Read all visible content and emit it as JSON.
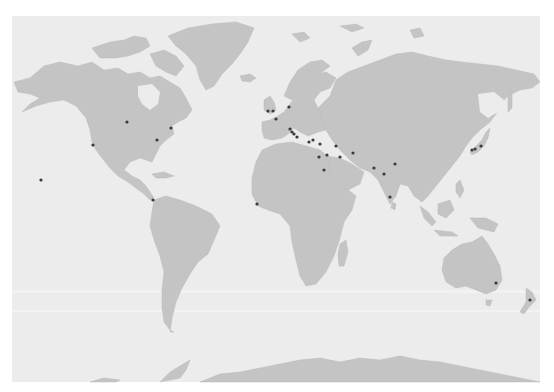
{
  "map": {
    "type": "world-map",
    "projection": "miller-like cylindrical",
    "colors": {
      "ocean": "#ececec",
      "land": "#c4c4c4",
      "marker": "#3a3a3a",
      "background": "#ffffff"
    },
    "markers": [
      {
        "region": "Hawaii",
        "x": 41,
        "y": 180
      },
      {
        "region": "US West Coast",
        "x": 93,
        "y": 145
      },
      {
        "region": "US Central",
        "x": 127,
        "y": 122
      },
      {
        "region": "US Northeast",
        "x": 171,
        "y": 128
      },
      {
        "region": "US East",
        "x": 157,
        "y": 140
      },
      {
        "region": "Panama",
        "x": 153,
        "y": 200
      },
      {
        "region": "West Africa",
        "x": 257,
        "y": 204
      },
      {
        "region": "UK 1",
        "x": 268,
        "y": 111
      },
      {
        "region": "UK 2",
        "x": 273,
        "y": 111
      },
      {
        "region": "France",
        "x": 276,
        "y": 119
      },
      {
        "region": "Northern Europe",
        "x": 289,
        "y": 107
      },
      {
        "region": "Italy 1",
        "x": 290,
        "y": 129
      },
      {
        "region": "Italy 2",
        "x": 292,
        "y": 132
      },
      {
        "region": "Italy 3",
        "x": 294,
        "y": 134
      },
      {
        "region": "Italy 4",
        "x": 297,
        "y": 137
      },
      {
        "region": "Greece",
        "x": 309,
        "y": 142
      },
      {
        "region": "Turkey 1",
        "x": 313,
        "y": 140
      },
      {
        "region": "Turkey 2",
        "x": 320,
        "y": 144
      },
      {
        "region": "Egypt",
        "x": 319,
        "y": 157
      },
      {
        "region": "Levant",
        "x": 327,
        "y": 155
      },
      {
        "region": "Arabia",
        "x": 324,
        "y": 170
      },
      {
        "region": "Iraq",
        "x": 340,
        "y": 157
      },
      {
        "region": "Caucasus/Iran",
        "x": 336,
        "y": 146
      },
      {
        "region": "Afghanistan",
        "x": 353,
        "y": 153
      },
      {
        "region": "North India",
        "x": 374,
        "y": 168
      },
      {
        "region": "Himalaya",
        "x": 395,
        "y": 164
      },
      {
        "region": "Central India",
        "x": 384,
        "y": 174
      },
      {
        "region": "South India",
        "x": 390,
        "y": 197
      },
      {
        "region": "Japan 1",
        "x": 472,
        "y": 150
      },
      {
        "region": "Japan 2",
        "x": 475,
        "y": 149
      },
      {
        "region": "Japan 3",
        "x": 481,
        "y": 146
      },
      {
        "region": "Australia East",
        "x": 496,
        "y": 283
      },
      {
        "region": "New Zealand",
        "x": 530,
        "y": 300
      }
    ]
  }
}
